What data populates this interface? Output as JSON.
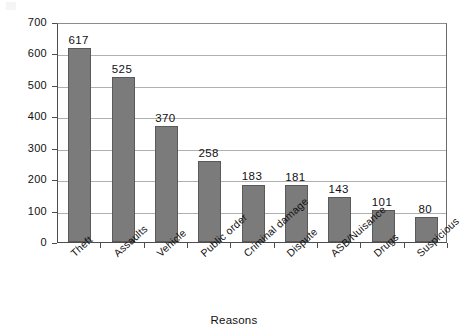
{
  "chart_data": {
    "type": "bar",
    "title": "",
    "subtitle": "",
    "xlabel": "Reasons",
    "ylabel": "Number of calls",
    "categories": [
      "Theft",
      "Assaults",
      "Vehicle",
      "Public order",
      "Criminal damage",
      "Dispute",
      "ASB/Nuisance",
      "Drugs",
      "Suspicious"
    ],
    "values": [
      617,
      525,
      370,
      258,
      183,
      181,
      143,
      101,
      80
    ],
    "value_labels": [
      "617",
      "525",
      "370",
      "258",
      "183",
      "181",
      "143",
      "101",
      "80"
    ],
    "ylim": [
      0,
      700
    ],
    "ytick_step": 100,
    "ytick_labels": [
      "0",
      "100",
      "200",
      "300",
      "400",
      "500",
      "600",
      "700"
    ],
    "ytick_values": [
      0,
      100,
      200,
      300,
      400,
      500,
      600,
      700
    ],
    "grid": "horizontal",
    "legend": "none",
    "bar_color": "#7b7b7b",
    "bar_border_color": "#5a5a5a",
    "gridline_color": "#b0b0b0",
    "axis_color": "#4d4d4d",
    "background_color": "#ffffff",
    "xtick_label_rotation": -42,
    "series": [
      {
        "name": "Number of calls",
        "values": [
          617,
          525,
          370,
          258,
          183,
          181,
          143,
          101,
          80
        ]
      }
    ]
  }
}
